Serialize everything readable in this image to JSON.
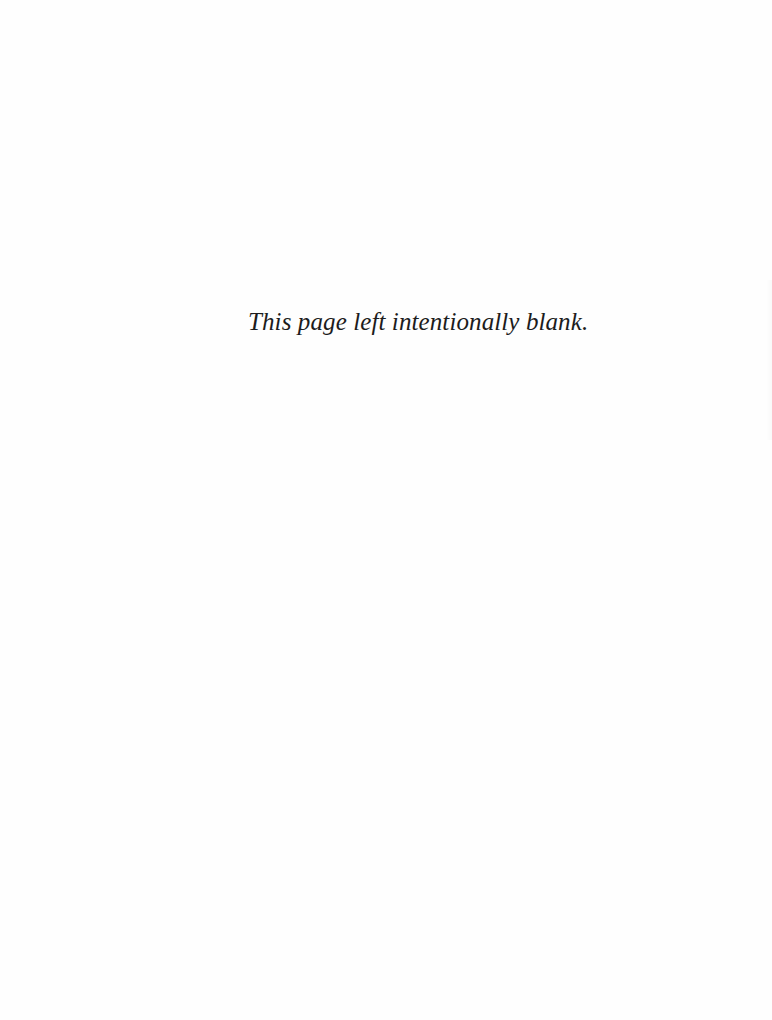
{
  "page": {
    "notice": "This page left intentionally blank.",
    "background_color": "#fefefe",
    "text_color": "#1c1c1c"
  }
}
